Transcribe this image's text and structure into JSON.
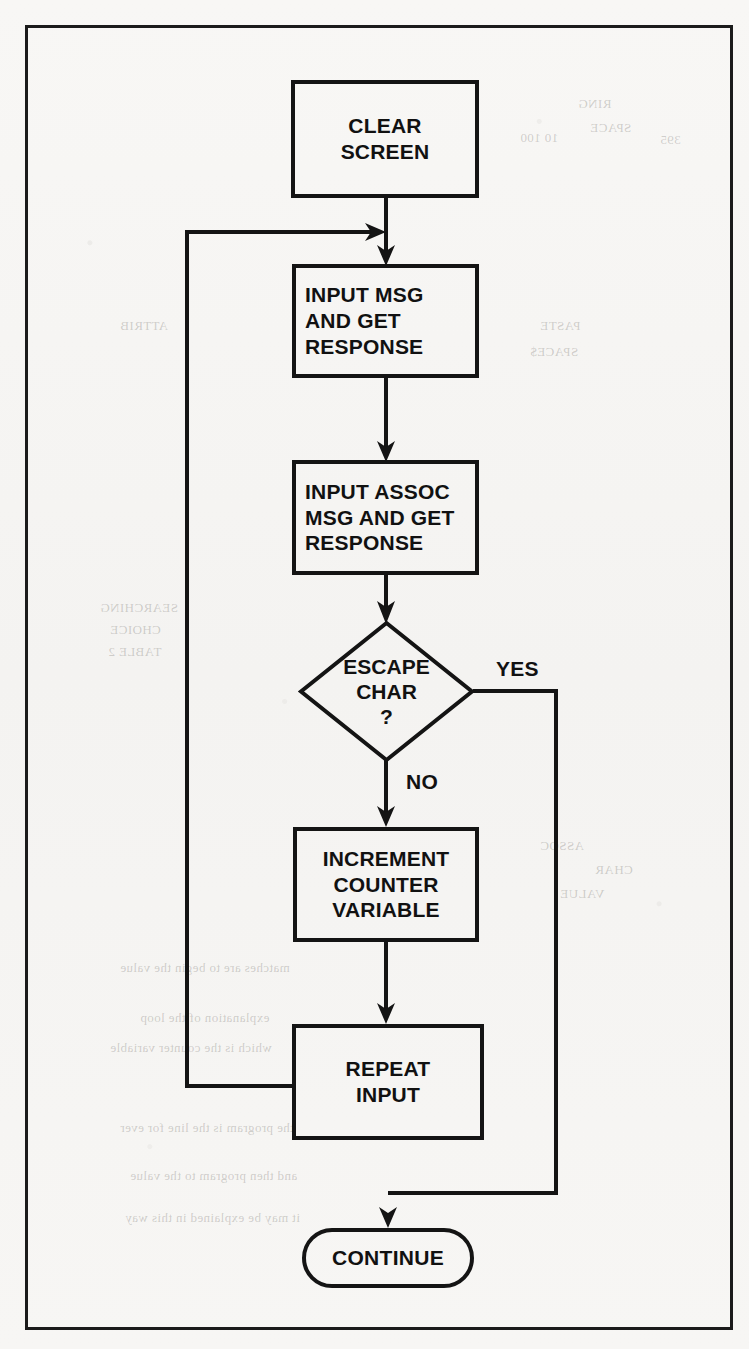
{
  "page": {
    "kind": "scanned-book-page-flowchart",
    "background_color": "#f7f6f4",
    "ink_color": "#141414"
  },
  "flowchart": {
    "title": "Message input loop flowchart",
    "nodes": [
      {
        "id": "clear-screen",
        "shape": "process",
        "align": "center",
        "lines": [
          "CLEAR",
          "SCREEN"
        ]
      },
      {
        "id": "input-msg",
        "shape": "process",
        "align": "left",
        "lines": [
          "INPUT MSG",
          "AND GET",
          "RESPONSE"
        ]
      },
      {
        "id": "input-assoc",
        "shape": "process",
        "align": "left",
        "lines": [
          "INPUT ASSOC",
          "MSG AND GET",
          "RESPONSE"
        ]
      },
      {
        "id": "escape-char",
        "shape": "decision",
        "align": "center",
        "lines": [
          "ESCAPE",
          "CHAR",
          "?"
        ]
      },
      {
        "id": "increment",
        "shape": "process",
        "align": "center",
        "lines": [
          "INCREMENT",
          "COUNTER",
          "VARIABLE"
        ]
      },
      {
        "id": "repeat-input",
        "shape": "process",
        "align": "center",
        "lines": [
          "REPEAT",
          "INPUT"
        ]
      },
      {
        "id": "continue",
        "shape": "terminal",
        "align": "center",
        "lines": [
          "CONTINUE"
        ]
      }
    ],
    "edge_labels": {
      "yes": "YES",
      "no": "NO"
    }
  },
  "bleed_through": [
    {
      "text": "RING",
      "x": 578,
      "y": 96
    },
    {
      "text": "SPACE",
      "x": 590,
      "y": 120
    },
    {
      "text": "395",
      "x": 660,
      "y": 132
    },
    {
      "text": "10 100",
      "x": 520,
      "y": 130
    },
    {
      "text": "PASTE",
      "x": 540,
      "y": 318
    },
    {
      "text": "SPACE$",
      "x": 530,
      "y": 344
    },
    {
      "text": "ATTRIB",
      "x": 120,
      "y": 318
    },
    {
      "text": "SEARCHING",
      "x": 100,
      "y": 600
    },
    {
      "text": "CHOICE",
      "x": 110,
      "y": 622
    },
    {
      "text": "TABLE 2",
      "x": 108,
      "y": 644
    },
    {
      "text": "ASSOC",
      "x": 540,
      "y": 838
    },
    {
      "text": "CHAR",
      "x": 595,
      "y": 862
    },
    {
      "text": "VALUE",
      "x": 560,
      "y": 886
    },
    {
      "text": "matches are to begin the value",
      "x": 120,
      "y": 960
    },
    {
      "text": "explanation of the loop",
      "x": 140,
      "y": 1010
    },
    {
      "text": "which is the counter variable",
      "x": 110,
      "y": 1040
    },
    {
      "text": "the program is the line for ever",
      "x": 120,
      "y": 1120
    },
    {
      "text": "and then program to the value",
      "x": 130,
      "y": 1168
    },
    {
      "text": "it may be explained in this way",
      "x": 125,
      "y": 1210
    }
  ]
}
